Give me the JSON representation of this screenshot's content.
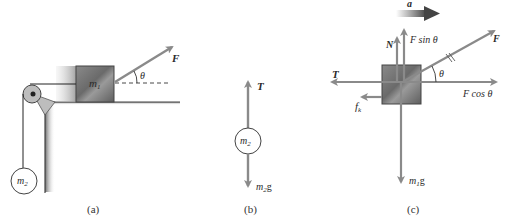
{
  "colors": {
    "arrow": "#8a8a8a",
    "block_dark": "#6f6f6f",
    "block_light": "#b5b5b5",
    "line": "#333333",
    "accel_arrow": "#555555"
  },
  "panel_a": {
    "caption": "(a)",
    "block_label": "m",
    "block_sub": "1",
    "hanging_label": "m",
    "hanging_sub": "2",
    "force_label": "F",
    "angle_label": "θ"
  },
  "panel_b": {
    "caption": "(b)",
    "mass_label": "m",
    "mass_sub": "2",
    "tension_label": "T",
    "weight_label": "m",
    "weight_sub": "2",
    "weight_suffix": "g"
  },
  "panel_c": {
    "caption": "(c)",
    "accel_label": "a",
    "normal_label": "N",
    "fsin_label": "F sin  θ",
    "force_label": "F",
    "angle_label": "θ",
    "tension_label": "T",
    "fcos_label": "F cos  θ",
    "friction_label": "f",
    "friction_sub": "k",
    "weight_label": "m",
    "weight_sub": "1",
    "weight_suffix": "g"
  }
}
